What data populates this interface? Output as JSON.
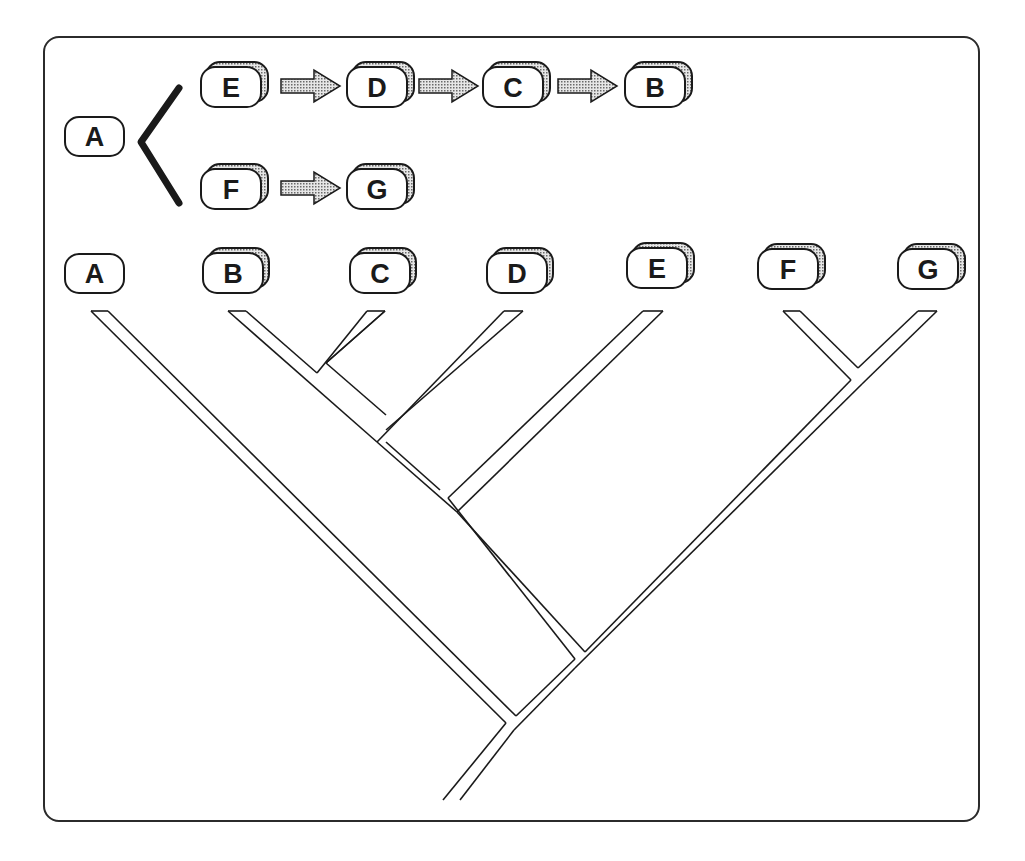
{
  "diagram": {
    "type": "phylogeny-comparison",
    "colors": {
      "stroke": "#1a1a1a",
      "node_fill": "#ffffff",
      "shadow_fill": "#bdbdbd",
      "arrow_fill": "#b0b0b0",
      "frame": "#2b2b2b"
    },
    "lineage": {
      "root": "A",
      "branches": [
        [
          "E",
          "D",
          "C",
          "B"
        ],
        [
          "F",
          "G"
        ]
      ]
    },
    "top_nodes": {
      "root": "A",
      "e": "E",
      "d": "D",
      "c": "C",
      "b": "B",
      "f": "F",
      "g": "G"
    },
    "tree_leaves": [
      "A",
      "B",
      "C",
      "D",
      "E",
      "F",
      "G"
    ],
    "tree_nodes": {
      "a": "A",
      "b": "B",
      "c": "C",
      "d": "D",
      "e": "E",
      "f": "F",
      "g": "G"
    },
    "cladogram_topology": "(A,(((B,C),D),E),(F,G)))"
  }
}
